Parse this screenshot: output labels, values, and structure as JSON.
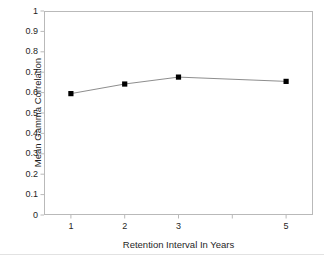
{
  "chart_data": {
    "type": "line",
    "title": "",
    "subtitle": "",
    "xlabel": "Retention Interval In Years",
    "ylabel": "Mean Gamma Correlation",
    "x": [
      1,
      2,
      3,
      5
    ],
    "values": [
      0.595,
      0.642,
      0.676,
      0.655
    ],
    "series": [
      {
        "name": "Mean Gamma Correlation",
        "values": [
          0.595,
          0.642,
          0.676,
          0.655
        ]
      }
    ],
    "categories": [
      "1",
      "2",
      "3",
      "5"
    ],
    "xlim": [
      0.5,
      5.5
    ],
    "ylim": [
      0,
      1
    ],
    "x_tick_values": [
      1,
      2,
      3,
      4,
      5
    ],
    "x_tick_labels": [
      "1",
      "2",
      "3",
      "",
      "5"
    ],
    "y_tick_values": [
      0,
      0.1,
      0.2,
      0.3,
      0.4,
      0.5,
      0.6,
      0.7,
      0.8,
      0.9,
      1
    ],
    "y_tick_labels": [
      "0",
      "0.1",
      "0.2",
      "0.3",
      "0.4",
      "0.5",
      "0.6",
      "0.7",
      "0.8",
      "0.9",
      "1"
    ],
    "grid": false,
    "legend": false,
    "legend_position": "none",
    "marker": "square",
    "marker_color": "#000000",
    "line_color": "#808080",
    "frame_color": "#b9b9b9",
    "background_color": "#ffffff"
  }
}
